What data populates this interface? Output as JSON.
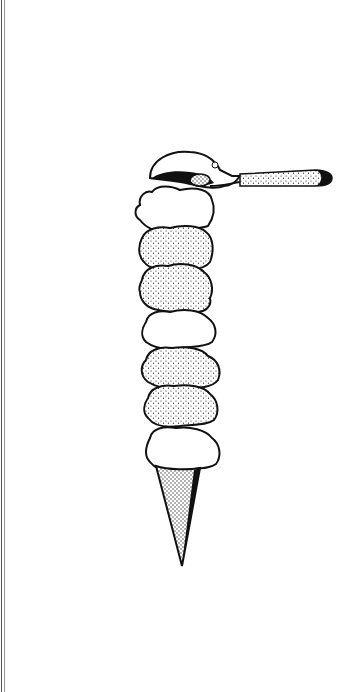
{
  "image": {
    "subject": "Ink illustration of a tall stacked ice cream cone with a scoop on top",
    "style": "black-and-white pen drawing with stippled shading",
    "background_color": "#ffffff",
    "ink_color": "#111111",
    "elements": [
      {
        "name": "ice-cream-scoop-utensil",
        "description": "metal scoop with stippled handle extending to the right"
      },
      {
        "name": "scoop-1",
        "shading": "plain"
      },
      {
        "name": "scoop-2",
        "shading": "stippled"
      },
      {
        "name": "scoop-3",
        "shading": "stippled"
      },
      {
        "name": "scoop-4",
        "shading": "plain"
      },
      {
        "name": "scoop-5",
        "shading": "stippled"
      },
      {
        "name": "scoop-6",
        "shading": "stippled"
      },
      {
        "name": "scoop-7",
        "shading": "plain"
      },
      {
        "name": "cone",
        "shading": "stippled",
        "shape": "long narrow pointed cone"
      }
    ],
    "scoop_count": 7
  }
}
